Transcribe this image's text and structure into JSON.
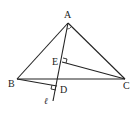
{
  "diagram": {
    "type": "geometry",
    "points": {
      "A": {
        "label": "A",
        "x": 68,
        "y": 23
      },
      "B": {
        "label": "B",
        "x": 17,
        "y": 79
      },
      "C": {
        "label": "C",
        "x": 125,
        "y": 79
      },
      "E": {
        "label": "E",
        "x": 62,
        "y": 62
      },
      "D": {
        "label": "D",
        "x": 57,
        "y": 86
      }
    },
    "line": {
      "label": "ℓ"
    },
    "segments": [
      "AB",
      "AC",
      "BC",
      "BD",
      "CE"
    ],
    "right_angles": [
      "E",
      "D"
    ],
    "colors": {
      "stroke": "#222222",
      "background": "#ffffff"
    }
  }
}
